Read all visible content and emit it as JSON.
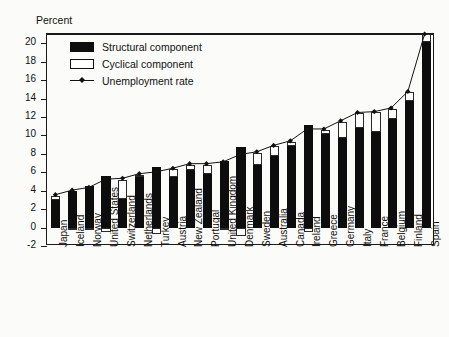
{
  "chart_data": {
    "type": "bar",
    "subtype": "stacked-bar-with-line",
    "title": "",
    "ylabel": "Percent",
    "xlabel": "",
    "ylim": [
      -2,
      21
    ],
    "yticks": [
      -2,
      0,
      2,
      4,
      6,
      8,
      10,
      12,
      14,
      16,
      18,
      20
    ],
    "grid": false,
    "legend_position": "top-left",
    "legend": [
      {
        "key": "structural",
        "label": "Structural component",
        "style": "filled-black-square",
        "color": "#0d0d0d"
      },
      {
        "key": "cyclical",
        "label": "Cyclical component",
        "style": "hollow-square",
        "color": "#ffffff"
      },
      {
        "key": "rate",
        "label": "Unemployment rate",
        "style": "line-with-diamond-marker",
        "color": "#111111"
      }
    ],
    "categories": [
      "Japan",
      "Iceland",
      "Norway",
      "United States",
      "Switzerland",
      "Netherlands",
      "Turkey",
      "Austria",
      "New Zealand",
      "Portugal",
      "United Kingdom",
      "Denmark",
      "Sweden",
      "Australia",
      "Canada",
      "Ireland",
      "Greece",
      "Germany",
      "Italy",
      "France",
      "Belgium",
      "Finland",
      "Spain"
    ],
    "series": [
      {
        "name": "Structural component",
        "values": [
          3.0,
          4.0,
          4.5,
          5.6,
          3.1,
          5.6,
          6.6,
          5.5,
          6.2,
          5.8,
          7.2,
          8.7,
          6.8,
          7.8,
          8.8,
          11.1,
          10.1,
          9.7,
          10.8,
          10.4,
          11.8,
          13.7,
          20.1
        ]
      },
      {
        "name": "Cyclical component",
        "values": [
          0.4,
          -0.1,
          -0.3,
          -0.5,
          2.1,
          0.1,
          -0.7,
          0.8,
          0.6,
          1.0,
          -0.2,
          -0.9,
          1.3,
          1.0,
          0.5,
          -0.5,
          0.5,
          1.8,
          1.6,
          2.1,
          1.1,
          1.0,
          0.9
        ]
      },
      {
        "name": "Unemployment rate",
        "values": [
          3.4,
          3.9,
          4.2,
          5.1,
          5.2,
          5.7,
          5.9,
          6.3,
          6.8,
          6.8,
          7.0,
          7.8,
          8.1,
          8.8,
          9.3,
          10.6,
          10.6,
          11.5,
          12.4,
          12.5,
          12.9,
          14.7,
          21.0
        ]
      }
    ]
  }
}
